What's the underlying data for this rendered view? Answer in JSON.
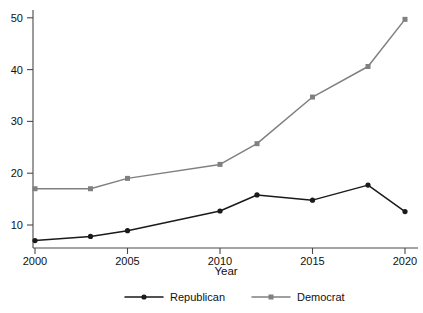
{
  "chart_data": {
    "type": "line",
    "title": "",
    "xlabel": "Year",
    "ylabel": "",
    "x": [
      2000,
      2003,
      2005,
      2010,
      2012,
      2015,
      2018,
      2020
    ],
    "xtick_labels": [
      "2000",
      "2005",
      "2010",
      "2015",
      "2020"
    ],
    "xtick_values": [
      2000,
      2005,
      2010,
      2015,
      2020
    ],
    "ytick_labels": [
      "10",
      "20",
      "30",
      "40",
      "50"
    ],
    "ytick_values": [
      10,
      20,
      30,
      40,
      50
    ],
    "xlim": [
      2000,
      2020
    ],
    "ylim": [
      6,
      51
    ],
    "grid": false,
    "legend_position": "bottom-center",
    "series": [
      {
        "name": "Republican",
        "color": "#1a1a1a",
        "marker": "circle",
        "values": [
          7.0,
          7.8,
          8.9,
          12.7,
          15.8,
          14.8,
          17.7,
          12.6
        ]
      },
      {
        "name": "Democrat",
        "color": "#808080",
        "marker": "square",
        "values": [
          17.0,
          17.0,
          19.0,
          21.7,
          25.7,
          34.7,
          40.6,
          49.7
        ]
      }
    ]
  },
  "axis": {
    "x_title": "Year"
  },
  "legend": {
    "items": [
      {
        "label": "Republican",
        "color": "#1a1a1a",
        "marker": "circle"
      },
      {
        "label": "Democrat",
        "color": "#808080",
        "marker": "square"
      }
    ]
  }
}
